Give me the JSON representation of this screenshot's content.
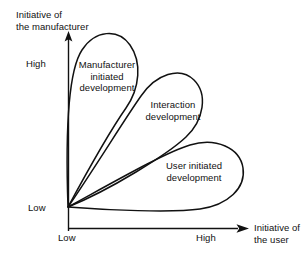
{
  "diagram": {
    "axes": {
      "y": {
        "label_line1": "Initiative of",
        "label_line2": "the manufacturer",
        "tick_low": "Low",
        "tick_high": "High"
      },
      "x": {
        "label_line1": "Initiative of",
        "label_line2": "the user",
        "tick_low": "Low",
        "tick_high": "High"
      }
    },
    "regions": [
      {
        "id": "manufacturer-initiated",
        "line1": "Manufacturer",
        "line2": "initiated",
        "line3": "development"
      },
      {
        "id": "interaction",
        "line1": "Interaction",
        "line2": "development",
        "line3": ""
      },
      {
        "id": "user-initiated",
        "line1": "User initiated",
        "line2": "development",
        "line3": ""
      }
    ],
    "colors": {
      "ink": "#111111",
      "background": "#ffffff"
    }
  }
}
